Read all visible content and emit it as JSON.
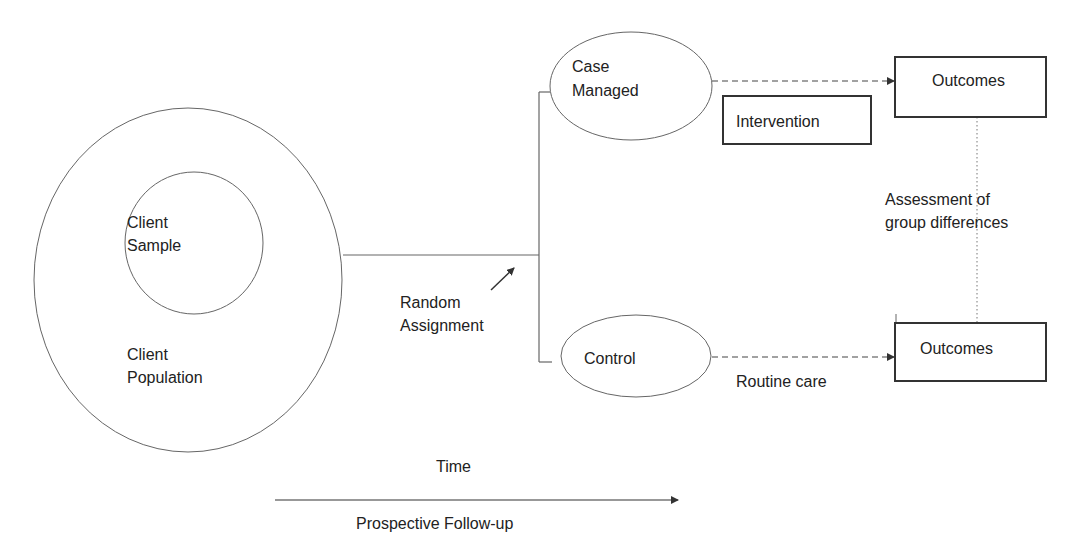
{
  "diagram": {
    "population": {
      "line1": "Client",
      "line2": "Population"
    },
    "sample": {
      "line1": "Client",
      "line2": "Sample"
    },
    "random_assignment": {
      "line1": "Random",
      "line2": "Assignment"
    },
    "case_managed": {
      "line1": "Case",
      "line2": "Managed"
    },
    "control": {
      "label": "Control"
    },
    "intervention": {
      "label": "Intervention"
    },
    "outcomes_top": {
      "label": "Outcomes"
    },
    "outcomes_bottom": {
      "label": "Outcomes"
    },
    "assessment": {
      "line1": "Assessment of",
      "line2": "group differences"
    },
    "routine_care": {
      "label": "Routine care"
    },
    "time": {
      "label": "Time"
    },
    "follow_up": {
      "label": "Prospective Follow-up"
    }
  },
  "colors": {
    "line": "#555555",
    "box_border": "#333333",
    "text": "#222222"
  }
}
